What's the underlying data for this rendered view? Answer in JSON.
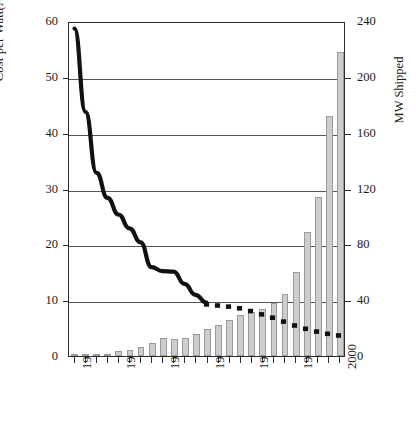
{
  "chart_data": {
    "type": "bar",
    "title": "",
    "subtitle": "",
    "xlabel": "",
    "ylabel": "Cost per Watt(AU$/Wp)",
    "y2label": "MW Shipped",
    "ylim": [
      0,
      60
    ],
    "y2lim": [
      0,
      240
    ],
    "grid": true,
    "legend": "none",
    "yticks": [
      0,
      10,
      20,
      30,
      40,
      50,
      60
    ],
    "y2ticks": [
      0,
      40,
      80,
      120,
      160,
      200,
      240
    ],
    "categories": [
      1976,
      1977,
      1978,
      1979,
      1980,
      1981,
      1982,
      1983,
      1984,
      1985,
      1986,
      1987,
      1988,
      1989,
      1990,
      1991,
      1992,
      1993,
      1994,
      1995,
      1996,
      1997,
      1998,
      1999,
      2000
    ],
    "xtick_labels": [
      "1976",
      "1980",
      "1984",
      "1988",
      "1992",
      "1996",
      "2000"
    ],
    "xtick_label_years": [
      1976,
      1980,
      1984,
      1988,
      1992,
      1996,
      2000
    ],
    "series": [
      {
        "name": "MW Shipped",
        "axis": "right",
        "type": "bar",
        "color": "#cdcdcd",
        "edge_color": "#9a9a9a",
        "values": [
          0.3,
          0.5,
          0.8,
          1.2,
          3.5,
          4.0,
          6.5,
          9.5,
          13.0,
          12.5,
          13.0,
          15.5,
          19.0,
          22.0,
          25.5,
          29.5,
          31.5,
          34.0,
          38.0,
          44.5,
          60.0,
          89.0,
          114.0,
          172.0,
          218.0
        ]
      },
      {
        "name": "Cost per Watt (historical)",
        "axis": "left",
        "type": "line",
        "style": "solid",
        "color": "#111111",
        "x": [
          1976,
          1977,
          1978,
          1979,
          1980,
          1981,
          1982,
          1983,
          1984,
          1985,
          1986,
          1987,
          1988
        ],
        "values": [
          59.0,
          44.0,
          33.0,
          28.5,
          25.5,
          23.0,
          20.5,
          16.0,
          15.3,
          15.2,
          13.0,
          11.0,
          9.6
        ]
      },
      {
        "name": "Cost per Watt (projected)",
        "axis": "left",
        "type": "line",
        "style": "dashed-square-markers",
        "color": "#111111",
        "x": [
          1988,
          1989,
          1990,
          1991,
          1992,
          1993,
          1994,
          1995,
          1996,
          1997,
          1998,
          1999,
          2000
        ],
        "values": [
          9.3,
          9.1,
          8.9,
          8.6,
          8.1,
          7.5,
          6.9,
          6.2,
          5.5,
          4.9,
          4.4,
          4.0,
          3.7
        ]
      }
    ]
  },
  "axes": {
    "left_title": "Cost per Watt(AU$/Wp)",
    "right_title": "MW Shipped"
  }
}
